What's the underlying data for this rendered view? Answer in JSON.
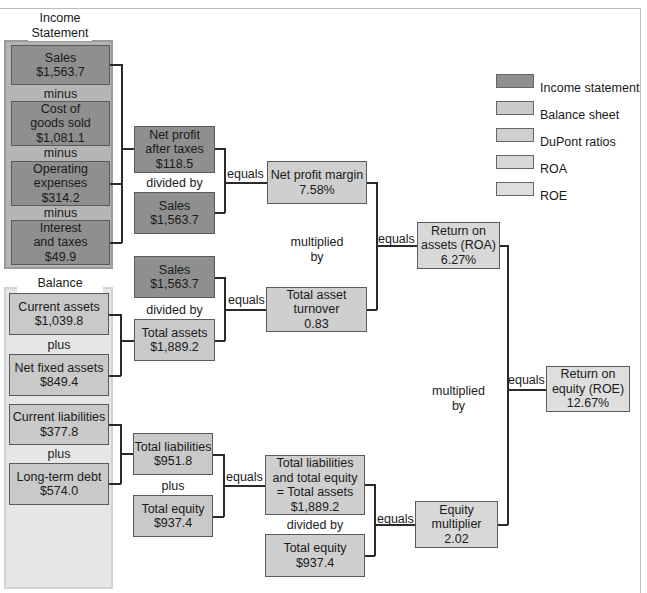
{
  "diagram": {
    "groups": {
      "income_statement": {
        "title": "Income\nStatement",
        "title_line1": "Income",
        "title_line2": "Statement"
      },
      "balance_sheet": {
        "title": "Balance Sheet"
      }
    },
    "income_items": [
      {
        "label": "Sales",
        "value": "$1,563.7"
      },
      {
        "label1": "Cost of",
        "label2": "goods sold",
        "value": "$1,081.1"
      },
      {
        "label": "Operating",
        "label2": "expenses",
        "value": "$314.2"
      },
      {
        "label": "Interest",
        "label2": "and taxes",
        "value": "$49.9"
      }
    ],
    "income_ops": [
      "minus",
      "minus",
      "minus"
    ],
    "balance_items": [
      {
        "label": "Current assets",
        "value": "$1,039.8"
      },
      {
        "label": "Net fixed assets",
        "value": "$849.4"
      },
      {
        "label": "Current liabilities",
        "value": "$377.8"
      },
      {
        "label": "Long-term debt",
        "value": "$574.0"
      }
    ],
    "balance_ops": [
      "plus",
      "plus"
    ],
    "level2": {
      "net_profit": {
        "label1": "Net profit",
        "label2": "after taxes",
        "value": "$118.5"
      },
      "sales_a": {
        "label": "Sales",
        "value": "$1,563.7"
      },
      "sales_b": {
        "label": "Sales",
        "value": "$1,563.7"
      },
      "total_assets": {
        "label": "Total assets",
        "value": "$1,889.2"
      },
      "total_liabilities": {
        "label": "Total liabilities",
        "value": "$951.8"
      },
      "total_equity": {
        "label": "Total equity",
        "value": "$937.4"
      },
      "op_divided_1": "divided by",
      "op_divided_2": "divided by",
      "op_plus": "plus"
    },
    "level3": {
      "net_profit_margin": {
        "label": "Net profit margin",
        "value": "7.58%"
      },
      "total_asset_turnover": {
        "label1": "Total asset",
        "label2": "turnover",
        "value": "0.83"
      },
      "tl_te": {
        "label1": "Total liabilities",
        "label2": "and total equity",
        "label3": "= Total assets",
        "value": "$1,889.2"
      },
      "total_equity": {
        "label": "Total equity",
        "value": "$937.4"
      },
      "op_multiplied_1": "multiplied",
      "op_multiplied_2": "by",
      "op_divided": "divided by"
    },
    "level4": {
      "roa": {
        "label1": "Return on",
        "label2": "assets (ROA)",
        "value": "6.27%"
      },
      "equity_multiplier": {
        "label1": "Equity",
        "label2": "multiplier",
        "value": "2.02"
      },
      "op_multiplied_1": "multiplied",
      "op_multiplied_2": "by"
    },
    "level5": {
      "roe": {
        "label1": "Return on",
        "label2": "equity (ROE)",
        "value": "12.67%"
      }
    },
    "equals_label": "equals",
    "legend": [
      {
        "label": "Income statement",
        "color": "#8f8f8f"
      },
      {
        "label": "Balance sheet",
        "color": "#c9c9c9"
      },
      {
        "label": "DuPont ratios",
        "color": "#cfcfcf"
      },
      {
        "label": "ROA",
        "color": "#d8d8d8"
      },
      {
        "label": "ROE",
        "color": "#dedede"
      }
    ]
  }
}
